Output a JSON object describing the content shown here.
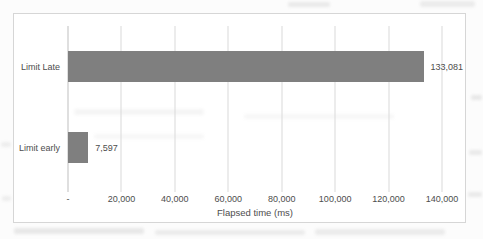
{
  "chart_data": {
    "type": "bar",
    "orientation": "horizontal",
    "title": "",
    "xlabel": "Flapsed time (ms)",
    "ylabel": "",
    "categories": [
      "Limit Late",
      "Limit early"
    ],
    "values": [
      133081,
      7597
    ],
    "data_labels": [
      "133,081",
      "7,597"
    ],
    "xlim": [
      0,
      140000
    ],
    "ticks": [
      {
        "value": 0,
        "label": "-"
      },
      {
        "value": 20000,
        "label": "20,000"
      },
      {
        "value": 40000,
        "label": "40,000"
      },
      {
        "value": 60000,
        "label": "60,000"
      },
      {
        "value": 80000,
        "label": "80,000"
      },
      {
        "value": 100000,
        "label": "100,000"
      },
      {
        "value": 120000,
        "label": "120,000"
      },
      {
        "value": 140000,
        "label": "140,000"
      }
    ],
    "bar_color": "#7f7f7f",
    "gridline_color": "#d9d9d9",
    "axis_line_color": "#bfbfbf",
    "text_color": "#4d4d4d",
    "grid": "vertical",
    "legend": "none"
  }
}
